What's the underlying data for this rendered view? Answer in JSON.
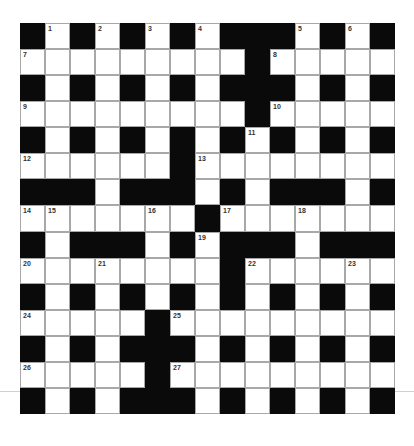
{
  "puzzle": {
    "type": "crossword",
    "size": 15,
    "grid": [
      "#.#.#.#.###.#.#",
      ".........#.....",
      "#.#.#.#.###.#.#",
      ".........#.....",
      "#.#.#.#.#.#.#.#",
      "......#........",
      "###.###.#.###.#",
      ".......#.......",
      "#.###.#.###.###",
      "........#......",
      "#.#.#.#.#.#.#.#",
      ".....#.........",
      "#.#.###.#.#.#.#",
      ".....#.........",
      "#.#.###.#.#.#.#"
    ],
    "numbers": [
      {
        "row": 0,
        "col": 1,
        "n": "1"
      },
      {
        "row": 0,
        "col": 3,
        "n": "2"
      },
      {
        "row": 0,
        "col": 5,
        "n": "3"
      },
      {
        "row": 0,
        "col": 7,
        "n": "4"
      },
      {
        "row": 0,
        "col": 11,
        "n": "5"
      },
      {
        "row": 0,
        "col": 13,
        "n": "6"
      },
      {
        "row": 1,
        "col": 0,
        "n": "7"
      },
      {
        "row": 1,
        "col": 10,
        "n": "8"
      },
      {
        "row": 3,
        "col": 0,
        "n": "9"
      },
      {
        "row": 3,
        "col": 10,
        "n": "10"
      },
      {
        "row": 4,
        "col": 9,
        "n": "11"
      },
      {
        "row": 5,
        "col": 0,
        "n": "12"
      },
      {
        "row": 5,
        "col": 7,
        "n": "13"
      },
      {
        "row": 7,
        "col": 0,
        "n": "14"
      },
      {
        "row": 7,
        "col": 1,
        "n": "15"
      },
      {
        "row": 7,
        "col": 5,
        "n": "16"
      },
      {
        "row": 7,
        "col": 8,
        "n": "17"
      },
      {
        "row": 7,
        "col": 11,
        "n": "18"
      },
      {
        "row": 8,
        "col": 7,
        "n": "19"
      },
      {
        "row": 9,
        "col": 0,
        "n": "20"
      },
      {
        "row": 9,
        "col": 3,
        "n": "21"
      },
      {
        "row": 9,
        "col": 9,
        "n": "22"
      },
      {
        "row": 9,
        "col": 13,
        "n": "23"
      },
      {
        "row": 11,
        "col": 0,
        "n": "24"
      },
      {
        "row": 11,
        "col": 6,
        "n": "25"
      },
      {
        "row": 13,
        "col": 0,
        "n": "26"
      },
      {
        "row": 13,
        "col": 6,
        "n": "27"
      }
    ]
  }
}
